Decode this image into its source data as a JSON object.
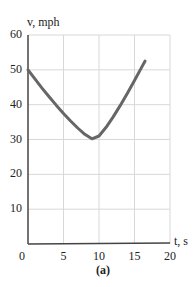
{
  "chart_data": {
    "type": "line",
    "title": "",
    "xlabel": "t, s",
    "ylabel": "v, mph",
    "caption": "(a)",
    "xlim": [
      0,
      20
    ],
    "ylim": [
      0,
      60
    ],
    "xticks": [
      "0",
      "5",
      "10",
      "15",
      "20"
    ],
    "yticks": [
      "10",
      "20",
      "30",
      "40",
      "50",
      "60"
    ],
    "grid": true,
    "legend": null,
    "series": [
      {
        "name": "velocity",
        "x": [
          0,
          1,
          2,
          3,
          4,
          5,
          6,
          7,
          8,
          9,
          10,
          11,
          12,
          13,
          14,
          15,
          16,
          16.5
        ],
        "values": [
          50,
          47.3,
          44.7,
          42.2,
          39.8,
          37.5,
          35.3,
          33.3,
          31.5,
          30.2,
          31.0,
          33.5,
          36.5,
          39.8,
          43.3,
          46.9,
          50.7,
          52.5
        ]
      }
    ]
  }
}
